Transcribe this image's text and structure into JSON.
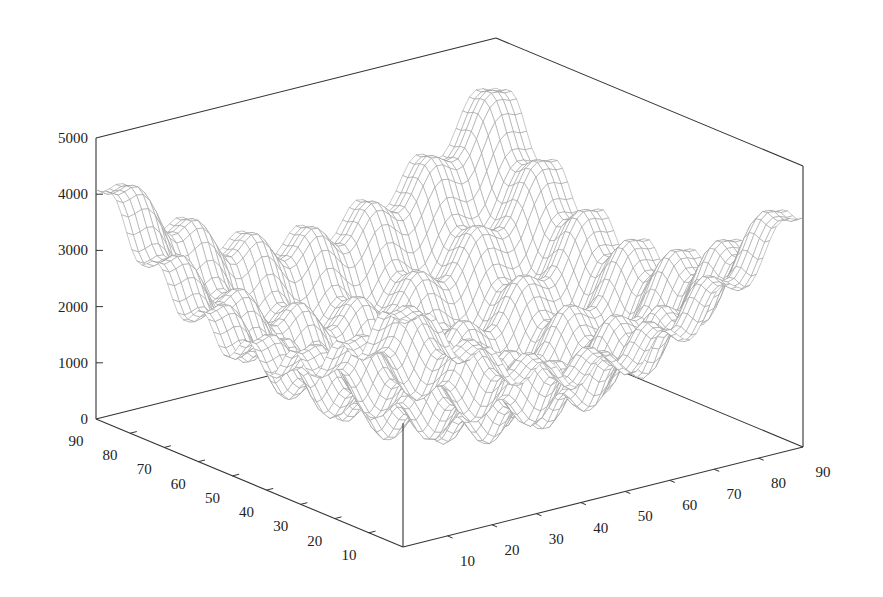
{
  "chart_data": {
    "type": "surface3d",
    "title": "",
    "xlabel": "",
    "ylabel": "",
    "zlabel": "",
    "x_range": [
      0,
      90
    ],
    "y_range": [
      0,
      90
    ],
    "z_range": [
      0,
      5000
    ],
    "x_ticks": [
      10,
      20,
      30,
      40,
      50,
      60,
      70,
      80,
      90
    ],
    "y_ticks": [
      10,
      20,
      30,
      40,
      50,
      60,
      70,
      80,
      90
    ],
    "z_ticks": [
      0,
      1000,
      2000,
      3000,
      4000,
      5000
    ],
    "x_tick_labels": [
      "10",
      "20",
      "30",
      "40",
      "50",
      "60",
      "70",
      "80",
      "90"
    ],
    "y_tick_labels": [
      "10",
      "20",
      "30",
      "40",
      "50",
      "60",
      "70",
      "80",
      "90"
    ],
    "z_tick_labels": [
      "0",
      "1000",
      "2000",
      "3000",
      "4000",
      "5000"
    ],
    "surface": {
      "description": "Rastrigin-like multimodal surface: quadratic bowl centered near (45,45) with cosine ripples",
      "function": "(x-45)^2 + (y-45)^2 + 250*(2 - cos(2*pi*x/13) - cos(2*pi*y/13))",
      "grid_step": 1.5,
      "corner_values_approx": {
        "(0,0)": 5000,
        "(0,90)": 5000,
        "(90,0)": 5000,
        "(90,90)": 5000
      },
      "min_approx": 0
    },
    "grid": false,
    "legend": null,
    "style": {
      "mesh_color": "#9a9a9a",
      "axis_color": "#333333",
      "background": "#ffffff"
    }
  }
}
